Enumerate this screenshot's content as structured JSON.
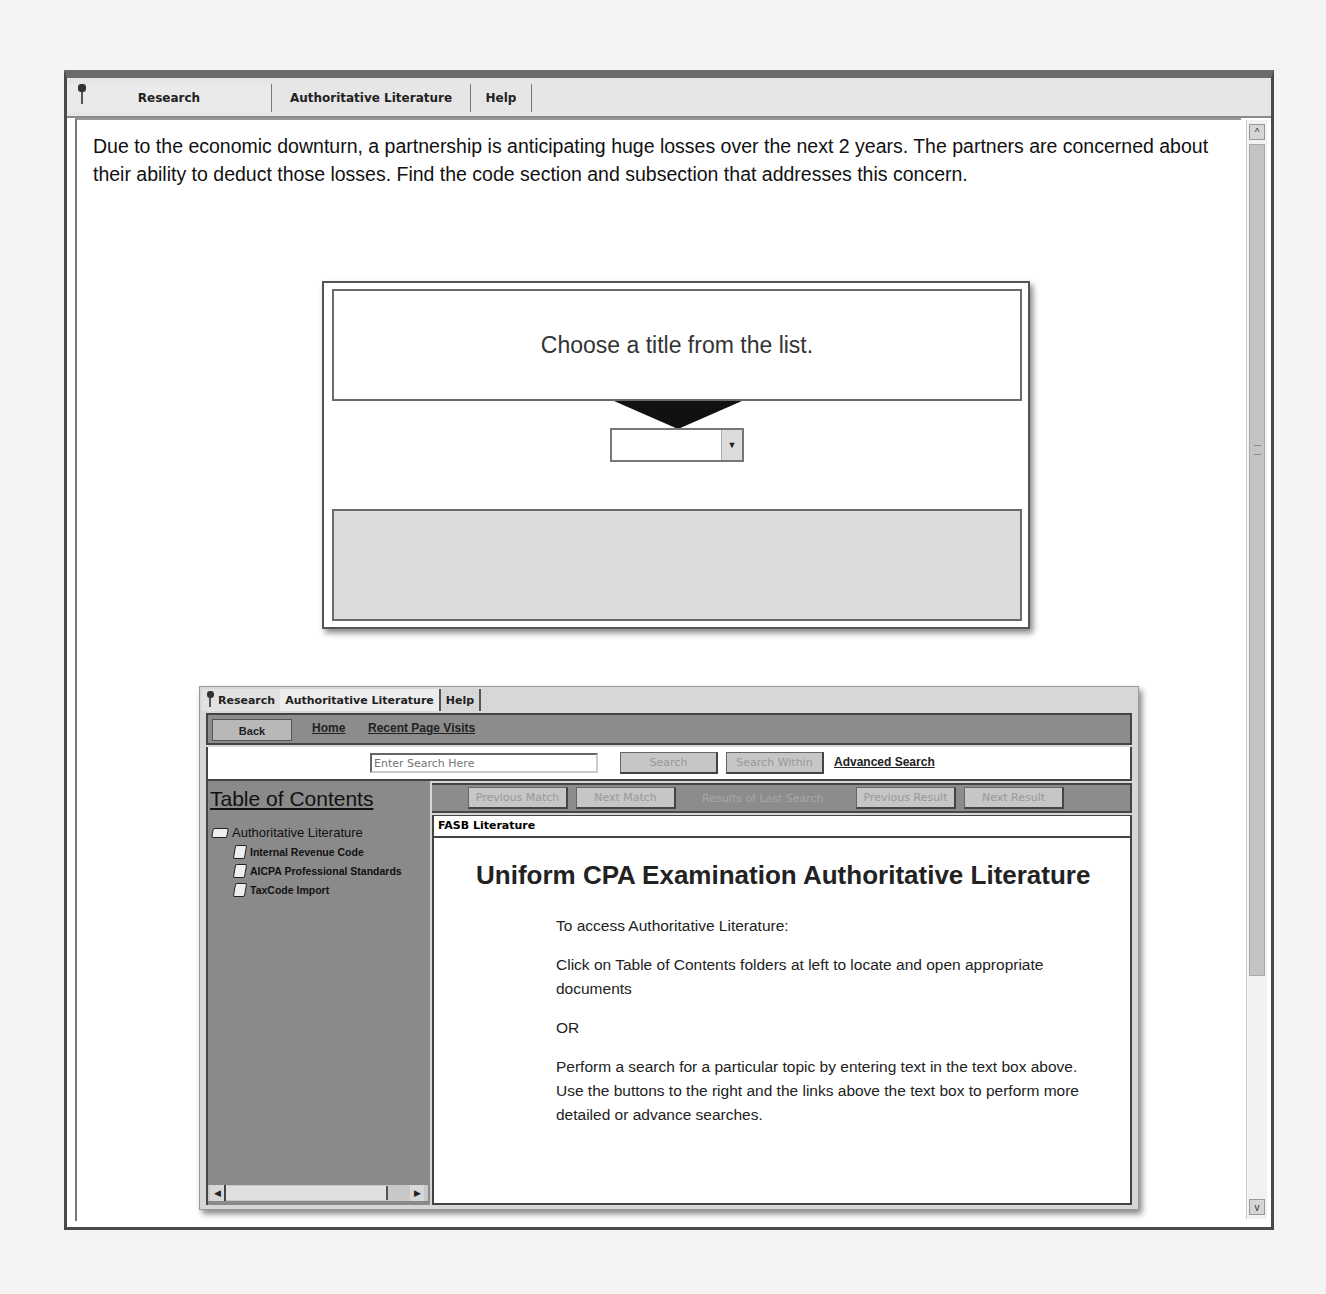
{
  "main_tabs": [
    {
      "label": "Research",
      "icon": "pin-icon"
    },
    {
      "label": "Authoritative Literature"
    },
    {
      "label": "Help"
    }
  ],
  "question": "Due to the economic downturn, a partnership is anticipating huge losses over the next 2 years.  The partners are concerned about their ability to deduct those losses.  Find the code section and subsection that addresses this concern.",
  "chooser": {
    "prompt": "Choose a title from the list.",
    "select_value": "",
    "answer": ""
  },
  "scrollbar": {
    "up": "^",
    "down": "v"
  },
  "literature": {
    "tabs": [
      {
        "label": "Research"
      },
      {
        "label": "Authoritative Literature"
      },
      {
        "label": "Help"
      }
    ],
    "nav": {
      "back": "Back",
      "home": "Home",
      "recent": "Recent Page Visits"
    },
    "search": {
      "placeholder": "Enter Search Here",
      "search_btn": "Search",
      "search_within_btn": "Search Within",
      "advanced": "Advanced Search"
    },
    "match_bar": {
      "previous_match": "Previous Match",
      "next_match": "Next Match",
      "results_label": "Results of Last Search",
      "previous_result": "Previous Result",
      "next_result": "Next Result"
    },
    "toc": {
      "title": "Table of Contents",
      "root": "Authoritative Literature",
      "children": [
        "Internal Revenue Code",
        "AICPA Professional Standards",
        "TaxCode Import"
      ]
    },
    "doc": {
      "section": "FASB Literature",
      "heading": "Uniform CPA Examination Authoritative Literature",
      "paragraphs": [
        "To access Authoritative Literature:",
        "Click on Table of Contents folders at left to locate and open appropriate documents",
        "OR",
        "Perform a search for a particular topic by entering text in the text box above.  Use the buttons to the right and the links above the text box to perform more detailed or advance searches."
      ]
    }
  }
}
